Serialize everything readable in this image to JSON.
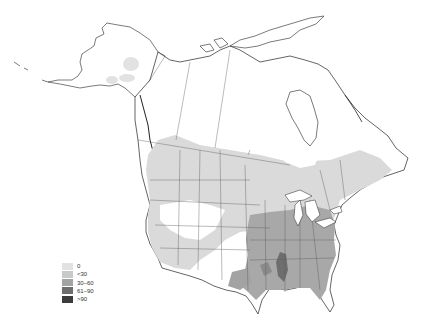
{
  "map": {
    "title": "",
    "region": "North America (Alaska, Canada, contiguous United States)",
    "colors": {
      "background": "#ffffff",
      "outline": "#222222",
      "border": "#555555"
    }
  },
  "legend": {
    "items": [
      {
        "label": "0",
        "color": "#e2e2e2"
      },
      {
        "label": "<30",
        "color": "#c9c9c9"
      },
      {
        "label": "30–60",
        "color": "#a3a3a3"
      },
      {
        "label": "61–90",
        "color": "#6e6e6e"
      },
      {
        "label": ">90",
        "color": "#3c3c3c"
      }
    ]
  }
}
